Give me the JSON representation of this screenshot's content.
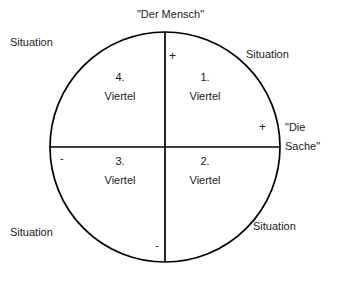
{
  "diagram": {
    "shape": "circle-with-crosshair-axes",
    "colors": {
      "background": "#ffffff",
      "stroke": "#000000",
      "text": "#1a1a1a"
    },
    "geometry": {
      "center_x": 165,
      "center_y": 147,
      "radius": 115,
      "stroke_width": 1.6
    },
    "axes": {
      "vertical": {
        "name": "Der Mensch Achse",
        "top_label": "\"Der Mensch\"",
        "top_sign": "+",
        "bottom_sign": "-"
      },
      "horizontal": {
        "name": "Die Sache Achse",
        "right_label_line1": "\"Die",
        "right_label_line2": "Sache\"",
        "right_sign": "+",
        "left_sign": "-"
      }
    },
    "quadrants": [
      {
        "id": "quadrant-1",
        "position": "upper-right",
        "number": "1.",
        "word": "Viertel"
      },
      {
        "id": "quadrant-2",
        "position": "lower-right",
        "number": "2.",
        "word": "Viertel"
      },
      {
        "id": "quadrant-3",
        "position": "lower-left",
        "number": "3.",
        "word": "Viertel"
      },
      {
        "id": "quadrant-4",
        "position": "upper-left",
        "number": "4.",
        "word": "Viertel"
      }
    ],
    "corner_labels": [
      {
        "id": "situation-top-left",
        "text": "Situation"
      },
      {
        "id": "situation-top-right",
        "text": "Situation"
      },
      {
        "id": "situation-bottom-left",
        "text": "Situation"
      },
      {
        "id": "situation-bottom-right",
        "text": "Situation"
      }
    ]
  }
}
